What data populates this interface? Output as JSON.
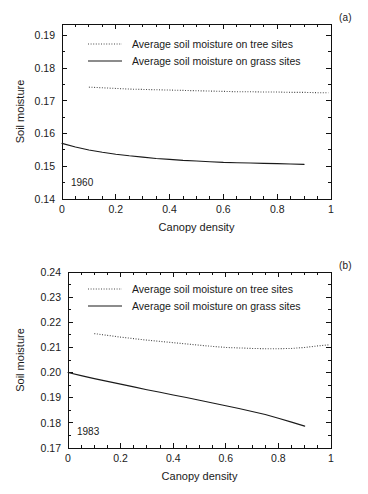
{
  "figure": {
    "background": "#ffffff",
    "line_color": "#1a1a1a",
    "dotted_color": "#4a4a4a"
  },
  "panels": [
    {
      "tag": "(a)",
      "year_label": "1960",
      "xlabel": "Canopy density",
      "ylabel": "Soil moisture"
    },
    {
      "tag": "(b)",
      "year_label": "1983",
      "xlabel": "Canopy density",
      "ylabel": "Soil moisture"
    }
  ],
  "legend": {
    "tree_label": "Average soil moisture on tree sites",
    "grass_label": "Average soil moisture on grass sites"
  },
  "chart_data": [
    {
      "type": "line",
      "title": "",
      "panel_tag": "(a)",
      "annotation": "1960",
      "xlabel": "Canopy density",
      "ylabel": "Soil moisture",
      "xlim": [
        0,
        1
      ],
      "ylim": [
        0.14,
        0.1935
      ],
      "xticks": [
        0,
        0.2,
        0.4,
        0.6,
        0.8,
        1
      ],
      "xtick_labels": [
        "0",
        "0.2",
        "0.4",
        "0.6",
        "0.8",
        "1"
      ],
      "yticks": [
        0.14,
        0.15,
        0.16,
        0.17,
        0.18,
        0.19
      ],
      "ytick_labels": [
        "0.14",
        "0.15",
        "0.16",
        "0.17",
        "0.18",
        "0.19"
      ],
      "x_minor_tick_step": 0.05,
      "y_minor_tick_step": 0.005,
      "grid": false,
      "legend_position": "inside-top-center",
      "series": [
        {
          "name": "Average soil moisture on tree sites",
          "style": "dotted",
          "x": [
            0.1,
            0.15,
            0.2,
            0.25,
            0.3,
            0.35,
            0.4,
            0.45,
            0.5,
            0.55,
            0.6,
            0.65,
            0.7,
            0.75,
            0.8,
            0.85,
            0.9,
            0.95,
            0.99
          ],
          "values": [
            0.1742,
            0.174,
            0.1738,
            0.1736,
            0.1735,
            0.1734,
            0.1733,
            0.1732,
            0.1731,
            0.173,
            0.1729,
            0.1728,
            0.1728,
            0.1727,
            0.1727,
            0.1726,
            0.1726,
            0.1725,
            0.1725
          ]
        },
        {
          "name": "Average soil moisture on grass sites",
          "style": "solid",
          "x": [
            0.0,
            0.05,
            0.1,
            0.15,
            0.2,
            0.25,
            0.3,
            0.35,
            0.4,
            0.45,
            0.5,
            0.55,
            0.6,
            0.65,
            0.7,
            0.75,
            0.8,
            0.85,
            0.9
          ],
          "values": [
            0.157,
            0.1559,
            0.155,
            0.1543,
            0.1537,
            0.1532,
            0.1528,
            0.1524,
            0.1521,
            0.1518,
            0.1516,
            0.1514,
            0.1512,
            0.1511,
            0.151,
            0.1509,
            0.1508,
            0.1507,
            0.1506
          ]
        }
      ]
    },
    {
      "type": "line",
      "title": "",
      "panel_tag": "(b)",
      "annotation": "1983",
      "xlabel": "Canopy density",
      "ylabel": "Soil moisture",
      "xlim": [
        0,
        1
      ],
      "ylim": [
        0.17,
        0.24
      ],
      "xticks": [
        0,
        0.2,
        0.4,
        0.6,
        0.8,
        1
      ],
      "xtick_labels": [
        "0",
        "0.2",
        "0.4",
        "0.6",
        "0.8",
        "1"
      ],
      "yticks": [
        0.17,
        0.18,
        0.19,
        0.2,
        0.21,
        0.22,
        0.23,
        0.24
      ],
      "ytick_labels": [
        "0.17",
        "0.18",
        "0.19",
        "0.20",
        "0.21",
        "0.22",
        "0.23",
        "0.24"
      ],
      "x_minor_tick_step": 0.05,
      "y_minor_tick_step": 0.005,
      "grid": false,
      "legend_position": "inside-top-center",
      "series": [
        {
          "name": "Average soil moisture on tree sites",
          "style": "dotted",
          "x": [
            0.1,
            0.15,
            0.2,
            0.25,
            0.3,
            0.35,
            0.4,
            0.45,
            0.5,
            0.55,
            0.6,
            0.65,
            0.7,
            0.75,
            0.8,
            0.85,
            0.9,
            0.95,
            0.99
          ],
          "values": [
            0.2155,
            0.2148,
            0.2141,
            0.2135,
            0.2129,
            0.2124,
            0.2119,
            0.2114,
            0.2109,
            0.2104,
            0.21,
            0.2098,
            0.2096,
            0.2095,
            0.2095,
            0.2096,
            0.21,
            0.2106,
            0.211
          ]
        },
        {
          "name": "Average soil moisture on grass sites",
          "style": "solid",
          "x": [
            0.0,
            0.05,
            0.1,
            0.15,
            0.2,
            0.25,
            0.3,
            0.35,
            0.4,
            0.45,
            0.5,
            0.55,
            0.6,
            0.65,
            0.7,
            0.75,
            0.8,
            0.85,
            0.9
          ],
          "values": [
            0.2,
            0.1988,
            0.1976,
            0.1965,
            0.1954,
            0.1943,
            0.1932,
            0.1922,
            0.1911,
            0.1901,
            0.189,
            0.1879,
            0.1868,
            0.1857,
            0.1845,
            0.1833,
            0.1818,
            0.1803,
            0.1787
          ]
        }
      ]
    }
  ]
}
